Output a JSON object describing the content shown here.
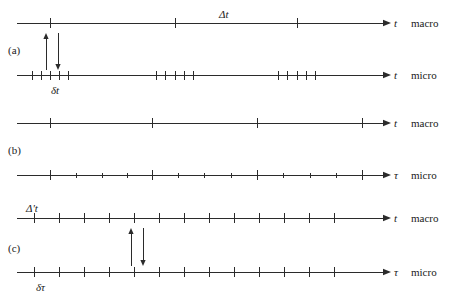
{
  "figure": {
    "stroke_color": "#2b2b2b",
    "background": "#ffffff"
  },
  "panels": [
    {
      "id": "a",
      "label": "(a)",
      "label_x": 8,
      "label_y": 45,
      "axes": [
        {
          "name": "macro",
          "variable": "t",
          "scale": "micro",
          "scale_label": "macro",
          "y": 23,
          "x_start": 17,
          "x_end": 383,
          "ticks": [
            {
              "x": 50,
              "h": 10
            },
            {
              "x": 175,
              "h": 10
            },
            {
              "x": 297,
              "h": 10
            }
          ],
          "var_x": 394,
          "scale_x": 411
        },
        {
          "name": "micro",
          "variable": "t",
          "scale_label": "micro",
          "y": 75,
          "x_start": 17,
          "x_end": 383,
          "ticks": [
            {
              "x": 32,
              "h": 9
            },
            {
              "x": 41,
              "h": 9
            },
            {
              "x": 50,
              "h": 9
            },
            {
              "x": 59,
              "h": 9
            },
            {
              "x": 68,
              "h": 9
            },
            {
              "x": 156,
              "h": 9
            },
            {
              "x": 165,
              "h": 9
            },
            {
              "x": 175,
              "h": 9
            },
            {
              "x": 184,
              "h": 9
            },
            {
              "x": 193,
              "h": 9
            },
            {
              "x": 278,
              "h": 9
            },
            {
              "x": 287,
              "h": 9
            },
            {
              "x": 297,
              "h": 9
            },
            {
              "x": 306,
              "h": 9
            },
            {
              "x": 315,
              "h": 9
            }
          ],
          "var_x": 394,
          "scale_x": 411
        }
      ],
      "arrows": [
        {
          "direction": "up",
          "x": 46,
          "y_top": 33,
          "y_bottom": 70
        },
        {
          "direction": "down",
          "x": 58,
          "y_top": 33,
          "y_bottom": 70
        }
      ],
      "annotations": [
        {
          "text": "Δt",
          "x": 219,
          "y": 9,
          "italic_tail": true,
          "name": "delta-t-macro-label"
        },
        {
          "text": "δt",
          "x": 51,
          "y": 85,
          "italic_tail": false,
          "name": "delta-t-micro-label"
        }
      ]
    },
    {
      "id": "b",
      "label": "(b)",
      "label_x": 8,
      "label_y": 145,
      "axes": [
        {
          "name": "macro",
          "variable": "t",
          "scale_label": "macro",
          "y": 123,
          "x_start": 17,
          "x_end": 383,
          "ticks": [
            {
              "x": 50,
              "h": 10
            },
            {
              "x": 152,
              "h": 10
            },
            {
              "x": 257,
              "h": 10
            },
            {
              "x": 362,
              "h": 10
            }
          ],
          "var_x": 394,
          "scale_x": 411
        },
        {
          "name": "micro",
          "variable": "τ",
          "scale_label": "micro",
          "y": 175,
          "x_start": 17,
          "x_end": 383,
          "ticks": [
            {
              "x": 50,
              "h": 10
            },
            {
              "x": 76,
              "h": 5
            },
            {
              "x": 102,
              "h": 5
            },
            {
              "x": 127,
              "h": 5
            },
            {
              "x": 152,
              "h": 10
            },
            {
              "x": 178,
              "h": 5
            },
            {
              "x": 204,
              "h": 5
            },
            {
              "x": 231,
              "h": 5
            },
            {
              "x": 257,
              "h": 10
            },
            {
              "x": 283,
              "h": 5
            },
            {
              "x": 310,
              "h": 5
            },
            {
              "x": 336,
              "h": 5
            },
            {
              "x": 362,
              "h": 10
            }
          ],
          "var_x": 394,
          "scale_x": 411
        }
      ],
      "arrows": [],
      "annotations": []
    },
    {
      "id": "c",
      "label": "(c)",
      "label_x": 8,
      "label_y": 243,
      "axes": [
        {
          "name": "macro",
          "variable": "t",
          "scale_label": "macro",
          "y": 218,
          "x_start": 17,
          "x_end": 383,
          "ticks": [
            {
              "x": 34,
              "h": 10
            },
            {
              "x": 59,
              "h": 10
            },
            {
              "x": 84,
              "h": 10
            },
            {
              "x": 109,
              "h": 10
            },
            {
              "x": 134,
              "h": 10
            },
            {
              "x": 159,
              "h": 10
            },
            {
              "x": 184,
              "h": 10
            },
            {
              "x": 209,
              "h": 10
            },
            {
              "x": 234,
              "h": 10
            },
            {
              "x": 259,
              "h": 10
            },
            {
              "x": 284,
              "h": 10
            },
            {
              "x": 309,
              "h": 10
            },
            {
              "x": 334,
              "h": 10
            }
          ],
          "var_x": 394,
          "scale_x": 411
        },
        {
          "name": "micro",
          "variable": "τ",
          "scale_label": "micro",
          "y": 272,
          "x_start": 17,
          "x_end": 383,
          "ticks": [
            {
              "x": 34,
              "h": 10
            },
            {
              "x": 59,
              "h": 10
            },
            {
              "x": 84,
              "h": 10
            },
            {
              "x": 109,
              "h": 10
            },
            {
              "x": 134,
              "h": 10
            },
            {
              "x": 159,
              "h": 10
            },
            {
              "x": 184,
              "h": 10
            },
            {
              "x": 209,
              "h": 10
            },
            {
              "x": 234,
              "h": 10
            },
            {
              "x": 259,
              "h": 10
            },
            {
              "x": 284,
              "h": 10
            },
            {
              "x": 309,
              "h": 10
            },
            {
              "x": 334,
              "h": 10
            }
          ],
          "var_x": 394,
          "scale_x": 411
        }
      ],
      "arrows": [
        {
          "direction": "up",
          "x": 131,
          "y_top": 228,
          "y_bottom": 266
        },
        {
          "direction": "down",
          "x": 143,
          "y_top": 228,
          "y_bottom": 266
        }
      ],
      "annotations": [
        {
          "text": "Δ't",
          "x": 26,
          "y": 203,
          "italic_tail": true,
          "name": "delta-prime-t-label"
        },
        {
          "text": "δτ",
          "x": 36,
          "y": 282,
          "italic_tail": false,
          "name": "delta-tau-label"
        }
      ]
    }
  ],
  "axis_labels": {
    "macro": "macro",
    "micro": "micro",
    "t": "t",
    "tau": "τ"
  }
}
